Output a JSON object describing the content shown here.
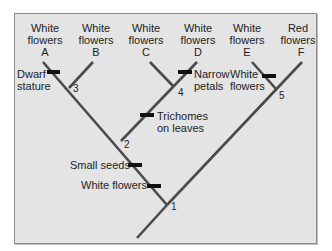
{
  "diagram": {
    "type": "cladogram",
    "taxa": [
      {
        "id": "A",
        "trait": "White flowers",
        "letter": "A"
      },
      {
        "id": "B",
        "trait": "White flowers",
        "letter": "B"
      },
      {
        "id": "C",
        "trait": "White flowers",
        "letter": "C"
      },
      {
        "id": "D",
        "trait": "White flowers",
        "letter": "D"
      },
      {
        "id": "E",
        "trait": "White flowers",
        "letter": "E"
      },
      {
        "id": "F",
        "trait": "Red flowers",
        "letter": "F"
      }
    ],
    "nodes": [
      "1",
      "2",
      "3",
      "4",
      "5"
    ],
    "character_changes": [
      {
        "label_line1": "Dwarf",
        "label_line2": "stature",
        "branch": "A"
      },
      {
        "label_line1": "Narrow",
        "label_line2": "petals",
        "branch": "D"
      },
      {
        "label_line1": "White",
        "label_line2": "flowers",
        "branch": "E"
      },
      {
        "label_line1": "Trichomes",
        "label_line2": "on leaves",
        "branch": "2-4"
      },
      {
        "label_line1": "Small seeds",
        "branch": "1-2"
      },
      {
        "label_line1": "White flowers",
        "branch": "1-2"
      }
    ],
    "colors": {
      "branch": "#4a4a4a",
      "marker": "#111111",
      "background": "#e4e4e4",
      "text": "#222222"
    }
  }
}
